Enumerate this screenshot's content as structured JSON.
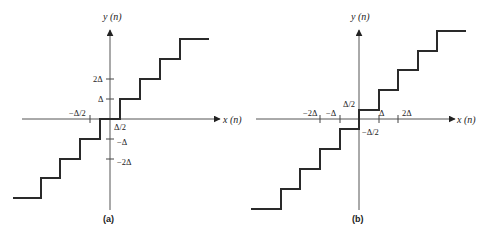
{
  "diagrams": [
    {
      "id": "a",
      "caption": "(a)",
      "y_axis_label": "y (n)",
      "x_axis_label": "x (n)",
      "ticks": {
        "y_pos": [
          "2Δ",
          "Δ"
        ],
        "y_neg": [
          "−Δ",
          "−2Δ"
        ],
        "x_neg": "−Δ/2",
        "x_pos": "Δ/2"
      }
    },
    {
      "id": "b",
      "caption": "(b)",
      "y_axis_label": "y (n)",
      "x_axis_label": "x (n)",
      "ticks": {
        "y_pos": "Δ/2",
        "y_neg": "−Δ/2",
        "x_neg": [
          "−2Δ",
          "−Δ"
        ],
        "x_pos": [
          "Δ",
          "2Δ"
        ]
      }
    }
  ]
}
